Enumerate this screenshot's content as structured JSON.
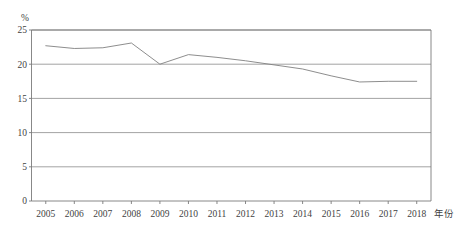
{
  "chart_data": {
    "type": "line",
    "title": "",
    "subtitle": "",
    "xlabel": "年份",
    "ylabel": "%",
    "x": [
      2005,
      2006,
      2007,
      2008,
      2009,
      2010,
      2011,
      2012,
      2013,
      2014,
      2015,
      2016,
      2017,
      2018
    ],
    "categories": [
      "2005",
      "2006",
      "2007",
      "2008",
      "2009",
      "2010",
      "2011",
      "2012",
      "2013",
      "2014",
      "2015",
      "2016",
      "2017",
      "2018"
    ],
    "values": [
      22.7,
      22.3,
      22.4,
      23.1,
      20.0,
      21.4,
      21.0,
      20.5,
      19.9,
      19.3,
      18.3,
      17.4,
      17.5,
      17.5
    ],
    "series": [
      {
        "name": "",
        "values": [
          22.7,
          22.3,
          22.4,
          23.1,
          20.0,
          21.4,
          21.0,
          20.5,
          19.9,
          19.3,
          18.3,
          17.4,
          17.5,
          17.5
        ]
      }
    ],
    "ylim": [
      0,
      25
    ],
    "yticks": [
      0,
      5,
      10,
      15,
      20,
      25
    ],
    "ytick_labels": [
      "0",
      "5",
      "10",
      "15",
      "20",
      "25"
    ],
    "xtick_labels": [
      "2005",
      "2006",
      "2007",
      "2008",
      "2009",
      "2010",
      "2011",
      "2012",
      "2013",
      "2014",
      "2015",
      "2016",
      "2017",
      "2018"
    ],
    "grid": true,
    "grid_axis": "y",
    "legend": false,
    "legend_position": "none",
    "annotations": [],
    "colors": {
      "line": "#808080",
      "grid": "#8c8c8c",
      "frame": "#7a7a7a",
      "text": "#3f3f3f",
      "background": "#ffffff"
    }
  },
  "axes": {
    "y_unit_label": "%",
    "x_axis_title": "年份"
  }
}
